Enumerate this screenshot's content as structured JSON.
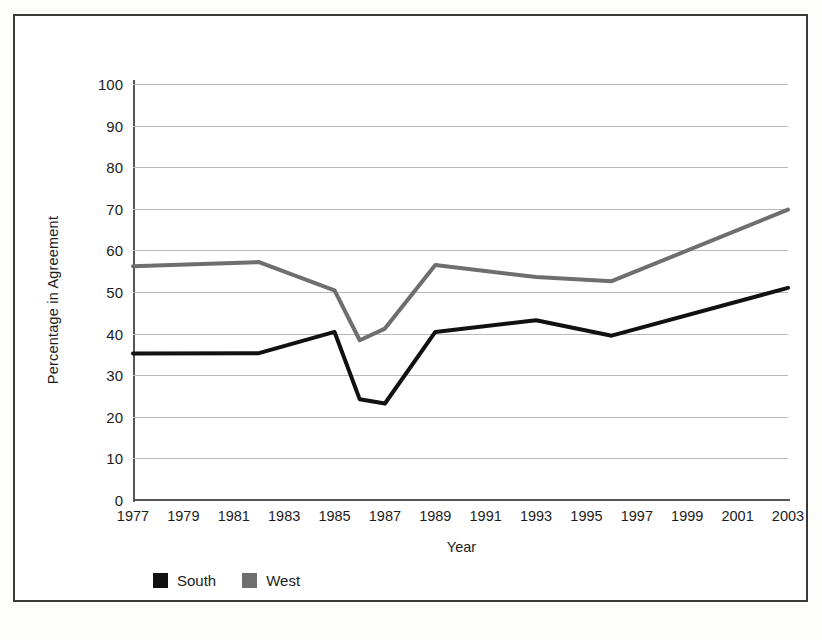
{
  "chart_data": {
    "type": "line",
    "title": "",
    "xlabel": "Year",
    "ylabel": "Percentage in Agreement",
    "xlim": [
      1977,
      2003
    ],
    "ylim": [
      0,
      100
    ],
    "ytick_values": [
      0,
      10,
      20,
      30,
      40,
      50,
      60,
      70,
      80,
      90,
      100
    ],
    "ytick_labels": [
      "0",
      "10",
      "20",
      "30",
      "40",
      "50",
      "60",
      "70",
      "80",
      "90",
      "100"
    ],
    "xtick_values": [
      1977,
      1979,
      1981,
      1983,
      1985,
      1987,
      1989,
      1991,
      1993,
      1995,
      1997,
      1999,
      2001,
      2003
    ],
    "xtick_labels": [
      "1977",
      "1979",
      "1981",
      "1983",
      "1985",
      "1987",
      "1989",
      "1991",
      "1993",
      "1995",
      "1997",
      "1999",
      "2001",
      "2003"
    ],
    "grid": "horizontal",
    "legend_position": "bottom-left",
    "series": [
      {
        "name": "South",
        "color": "#111111",
        "x": [
          1977,
          1982,
          1985,
          1986,
          1987,
          1989,
          1993,
          1996,
          2003
        ],
        "values": [
          35.2,
          35.3,
          40.4,
          24.2,
          23.2,
          40.4,
          43.2,
          39.5,
          51.0
        ]
      },
      {
        "name": "West",
        "color": "#6e6e6e",
        "x": [
          1977,
          1982,
          1985,
          1986,
          1987,
          1989,
          1993,
          1996,
          2003
        ],
        "values": [
          56.2,
          57.2,
          50.4,
          38.4,
          41.2,
          56.5,
          53.6,
          52.6,
          69.8
        ]
      }
    ]
  },
  "legend": {
    "items": [
      {
        "label": "South",
        "color": "#111111"
      },
      {
        "label": "West",
        "color": "#6e6e6e"
      }
    ]
  }
}
